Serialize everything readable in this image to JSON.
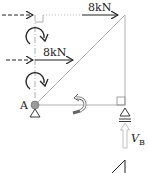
{
  "diagram": {
    "type": "truss free body diagram",
    "forces": [
      {
        "label": "8kN",
        "direction": "right",
        "location": "top joint"
      },
      {
        "label": "8kN",
        "direction": "right",
        "location": "mid-height on left line"
      }
    ],
    "nodes": [
      {
        "label": "A",
        "support": "pin"
      },
      {
        "label": "B",
        "support": "roller"
      }
    ],
    "reactions": [
      {
        "label": "V",
        "subscript": "B",
        "direction": "up"
      }
    ],
    "colors": {
      "member": "#b0b0b0",
      "arrow": "#222222",
      "node_fill": "#9a9a9a",
      "reaction_arrow": "#c8c8c8"
    }
  }
}
